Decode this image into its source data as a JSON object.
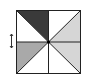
{
  "diagram": {
    "type": "pinwheel-square",
    "square": {
      "x": 16,
      "y": 10,
      "size": 64
    },
    "center_dot_color": "#000000",
    "stroke_color": "#222222",
    "triangles": [
      {
        "cell": "top-left",
        "region": "upper-right",
        "fill": "#3a3a3a"
      },
      {
        "cell": "top-left",
        "region": "lower-left",
        "fill": "#ffffff"
      },
      {
        "cell": "top-right",
        "region": "upper-left",
        "fill": "#ffffff"
      },
      {
        "cell": "top-right",
        "region": "lower-right",
        "fill": "#d6d6d6"
      },
      {
        "cell": "bottom-left",
        "region": "upper-left",
        "fill": "#a9a9a9"
      },
      {
        "cell": "bottom-left",
        "region": "lower-right",
        "fill": "#ffffff"
      },
      {
        "cell": "bottom-right",
        "region": "upper-right",
        "fill": "#d6d6d6"
      },
      {
        "cell": "bottom-right",
        "region": "lower-left",
        "fill": "#ffffff"
      }
    ],
    "side_marker": {
      "glyph": "double-arrow-vertical",
      "x": 11,
      "y": 41
    }
  }
}
